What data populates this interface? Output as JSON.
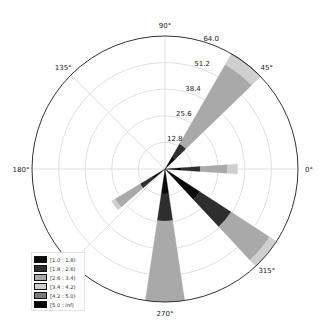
{
  "chart_data": {
    "type": "windrose",
    "title": "",
    "center": [
      165,
      169
    ],
    "radius_px": 133,
    "rmax": 64.0,
    "radial_ticks": [
      12.8,
      25.6,
      38.4,
      51.2,
      64.0
    ],
    "radial_tick_labels": [
      "12.8",
      "25.6",
      "38.4",
      "51.2",
      "64.0"
    ],
    "angle_ticks": [
      0,
      45,
      90,
      135,
      180,
      225,
      270,
      315
    ],
    "angle_tick_labels": [
      "0°",
      "45°",
      "90°",
      "135°",
      "180°",
      "",
      "270°",
      "315°"
    ],
    "grid": true,
    "legend_position": "lower left",
    "legend": [
      {
        "label": "[1.0 : 1.8)",
        "color": "#0a0a0a"
      },
      {
        "label": "[1.8 : 2.6)",
        "color": "#2e2e2e"
      },
      {
        "label": "[2.6 : 3.4)",
        "color": "#a9a9a9"
      },
      {
        "label": "[3.4 : 4.2)",
        "color": "#cfcfcf"
      },
      {
        "label": "[4.2 : 5.0)",
        "color": "#7a7a7a"
      },
      {
        "label": "[5.0 : inf)",
        "color": "#000000"
      }
    ],
    "sectors": [
      {
        "direction": 52,
        "width": 16,
        "segments": [
          7,
          7,
          44,
          6,
          0,
          0.6
        ]
      },
      {
        "direction": 0,
        "width": 8,
        "segments": [
          8,
          9,
          13,
          5,
          0,
          0
        ]
      },
      {
        "direction": 320,
        "width": 14,
        "segments": [
          20,
          18,
          22,
          4,
          0,
          0
        ]
      },
      {
        "direction": 270,
        "width": 17,
        "segments": [
          12,
          13,
          40,
          0,
          0,
          0
        ]
      },
      {
        "direction": 216,
        "width": 10,
        "segments": [
          7,
          7,
          14,
          2,
          0,
          0
        ]
      }
    ]
  }
}
